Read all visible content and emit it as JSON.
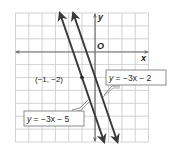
{
  "chart_data": {
    "type": "line",
    "title": "",
    "xlabel": "x",
    "ylabel": "y",
    "origin_label": "O",
    "xlim": [
      -6,
      4
    ],
    "ylim": [
      -7,
      3
    ],
    "grid": true,
    "grid_step": 1,
    "series": [
      {
        "name": "y = −3x − 2",
        "equation": "y = -3x - 2",
        "slope": -3,
        "intercept": -2,
        "x": [
          -1.667,
          1.667
        ],
        "y": [
          3,
          -7
        ]
      },
      {
        "name": "y = −3x − 5",
        "equation": "y = -3x - 5",
        "slope": -3,
        "intercept": -5,
        "x": [
          -2.667,
          0.667
        ],
        "y": [
          3,
          -7
        ]
      }
    ],
    "points": [
      {
        "x": -1,
        "y": -2,
        "label": "(−1, −2)",
        "on_series": "y = −3x − 5"
      }
    ],
    "annotations": [
      {
        "text": "y = −3x − 2",
        "box": true,
        "points_to": "y = −3x − 2"
      },
      {
        "text": "y = −3x − 5",
        "box": true,
        "points_to": "y = −3x − 5"
      }
    ]
  },
  "labels": {
    "x_axis": "x",
    "y_axis": "y",
    "origin": "O",
    "point": "(−1, −2)",
    "eq1_y": "y",
    "eq1_rest": " = −3x − 2",
    "eq2_y": "y",
    "eq2_rest": " = −3x − 5"
  },
  "colors": {
    "grid": "#c8c8c8",
    "axis": "#6d6e71",
    "line": "#3a3a3c",
    "text": "#231f20"
  }
}
